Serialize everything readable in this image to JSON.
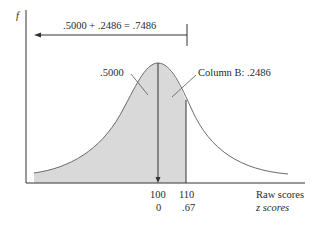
{
  "diagram": {
    "type": "normal-curve-area",
    "y_axis_label": "f",
    "equation": ".5000 + .2486 = .7486",
    "left_area_label": ".5000",
    "right_area_label": "Column B: .2486",
    "x_axis": {
      "raw_ticks": [
        "100",
        "110"
      ],
      "z_ticks": [
        "0",
        ".67"
      ],
      "raw_label": "Raw scores",
      "z_label": "z scores"
    },
    "colors": {
      "shade": "#d9d9d9",
      "line": "#333333",
      "curve": "#6a6a6a"
    }
  }
}
